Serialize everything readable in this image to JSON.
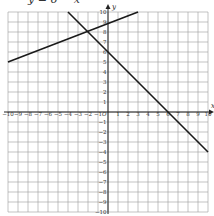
{
  "caption": "y = 6 − x",
  "chart_data": {
    "type": "line",
    "title": "",
    "xlabel": "x",
    "ylabel": "y",
    "xlim": [
      -10,
      10
    ],
    "ylim": [
      -10,
      10
    ],
    "grid": true,
    "x_ticks": [
      -10,
      -9,
      -8,
      -7,
      -6,
      -5,
      -4,
      -3,
      -2,
      -1,
      1,
      2,
      3,
      4,
      5,
      6,
      7,
      8,
      9,
      10
    ],
    "y_ticks": [
      -10,
      -9,
      -8,
      -7,
      -6,
      -5,
      -4,
      -3,
      -2,
      -1,
      1,
      2,
      3,
      4,
      5,
      6,
      7,
      8,
      9,
      10
    ],
    "origin_label": "O",
    "series": [
      {
        "name": "line-1",
        "x": [
          -10,
          3
        ],
        "y": [
          5,
          10
        ]
      },
      {
        "name": "line-2",
        "x": [
          -4,
          10
        ],
        "y": [
          10,
          -4
        ]
      }
    ]
  },
  "style": {
    "line_color": "#1a1a1a",
    "grid_color": "#9a9a9a",
    "axis_color": "#222222"
  }
}
